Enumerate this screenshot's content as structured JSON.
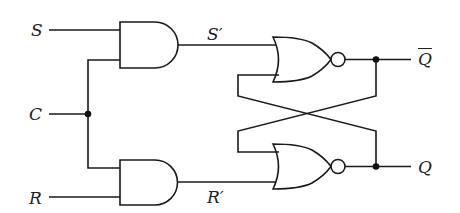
{
  "diagram": {
    "colors": {
      "line": "#1a1a1a",
      "background": "#ffffff",
      "junction": "#111111"
    },
    "inputs": {
      "s": {
        "label": "S"
      },
      "c": {
        "label": "C"
      },
      "r": {
        "label": "R"
      }
    },
    "intermediate": {
      "s_prime": {
        "label": "S′"
      },
      "r_prime": {
        "label": "R′"
      }
    },
    "outputs": {
      "q_bar": {
        "label": "Q"
      },
      "q": {
        "label": "Q"
      }
    },
    "gates": [
      {
        "id": "and-top",
        "type": "AND",
        "inputs": [
          "S",
          "C"
        ],
        "output": "S′"
      },
      {
        "id": "and-bottom",
        "type": "AND",
        "inputs": [
          "C",
          "R"
        ],
        "output": "R′"
      },
      {
        "id": "nor-top",
        "type": "NOR",
        "inputs": [
          "S′",
          "Q"
        ],
        "output": "Q̄"
      },
      {
        "id": "nor-bottom",
        "type": "NOR",
        "inputs": [
          "Q̄",
          "R′"
        ],
        "output": "Q"
      }
    ],
    "junctions": [
      "C-split",
      "Q̄-feedback",
      "Q-feedback"
    ]
  }
}
